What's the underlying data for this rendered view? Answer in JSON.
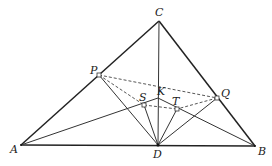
{
  "diagram": {
    "points": {
      "A": {
        "label": "A",
        "x": 21,
        "y": 145
      },
      "B": {
        "label": "B",
        "x": 255,
        "y": 146
      },
      "C": {
        "label": "C",
        "x": 159,
        "y": 21
      },
      "D": {
        "label": "D",
        "x": 158,
        "y": 145
      },
      "P": {
        "label": "P",
        "x": 99,
        "y": 75
      },
      "Q": {
        "label": "Q",
        "x": 217,
        "y": 98
      },
      "K": {
        "label": "K",
        "x": 158,
        "y": 98
      },
      "S": {
        "label": "S",
        "x": 144,
        "y": 105
      },
      "T": {
        "label": "T",
        "x": 177,
        "y": 109
      }
    },
    "solid_segments": [
      "AB",
      "BC",
      "CA",
      "CD",
      "PD",
      "QD",
      "AK",
      "KB",
      "SD",
      "TD"
    ],
    "dashed_segments": [
      "PQ",
      "PS",
      "QT",
      "ST"
    ],
    "right_angle_marks": [
      "P",
      "Q",
      "S",
      "T"
    ]
  }
}
